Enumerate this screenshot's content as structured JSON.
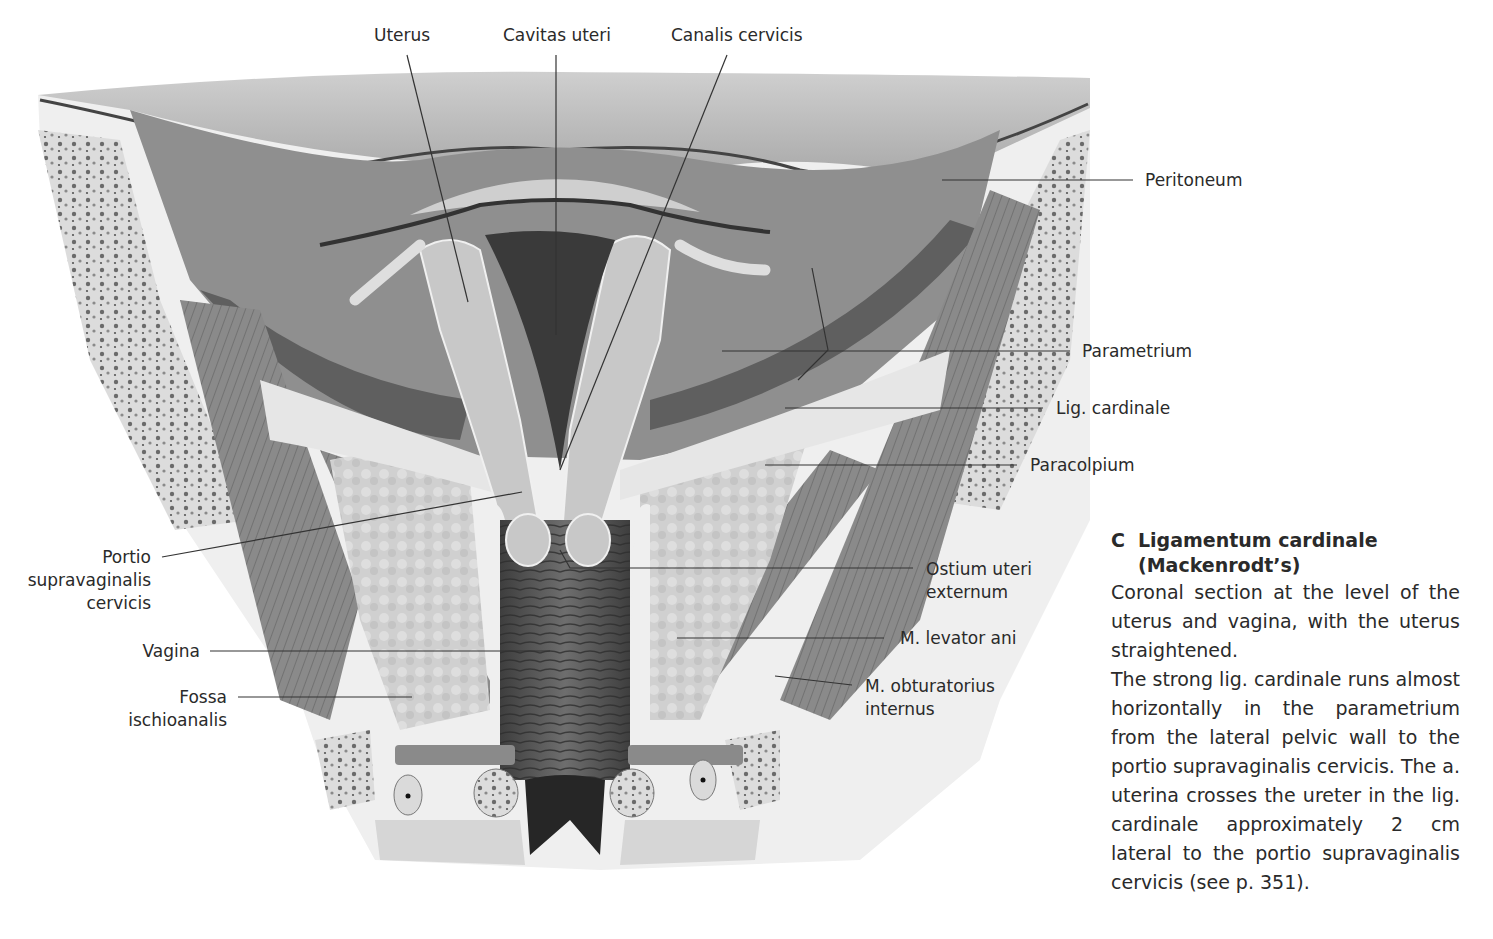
{
  "figure": {
    "colors": {
      "background": "#ffffff",
      "peritoneal_cavity": "#b8b8b8",
      "parametrium_dark": "#7e7e7e",
      "uterus": "#c9c9c9",
      "ligament": "#e4e4e4",
      "fat": "#d2d2d2",
      "muscle": "#8a8a8a",
      "bone": "#e8e8e8",
      "vagina": "#5e5e5e",
      "leader_line": "#333333"
    },
    "labels": {
      "top": [
        {
          "id": "uterus",
          "text": "Uterus"
        },
        {
          "id": "cavitas_uteri",
          "text": "Cavitas uteri"
        },
        {
          "id": "canalis_cervicis",
          "text": "Canalis cervicis"
        }
      ],
      "right": [
        {
          "id": "peritoneum",
          "text": "Peritoneum"
        },
        {
          "id": "parametrium",
          "text": "Parametrium"
        },
        {
          "id": "lig_cardinale",
          "text": "Lig. cardinale"
        },
        {
          "id": "paracolpium",
          "text": "Paracolpium"
        },
        {
          "id": "ostium_uteri_externum",
          "lines": [
            "Ostium uteri",
            "externum"
          ]
        },
        {
          "id": "m_levator_ani",
          "text": "M. levator ani"
        },
        {
          "id": "m_obturatorius_internus",
          "lines": [
            "M. obturatorius",
            "internus"
          ]
        }
      ],
      "left": [
        {
          "id": "portio_supravaginalis_cervicis",
          "lines": [
            "Portio",
            "supravaginalis",
            "cervicis"
          ]
        },
        {
          "id": "vagina",
          "text": "Vagina"
        },
        {
          "id": "fossa_ischioanalis",
          "lines": [
            "Fossa",
            "ischioanalis"
          ]
        }
      ]
    }
  },
  "caption": {
    "letter": "C",
    "title_line1": "Ligamentum cardinale",
    "title_line2": "(Mackenrodt’s)",
    "paragraph1": "Coronal section at the level of the uterus and vagina, with the uterus straightened.",
    "paragraph2": "The strong lig. cardinale runs almost horizontally in the parametrium from the lateral pelvic wall to the portio supravaginalis cervicis. The a. uterina crosses the ureter in the lig. cardinale approximately 2 cm lateral to the portio supravaginalis cervicis (see p. 351)."
  }
}
